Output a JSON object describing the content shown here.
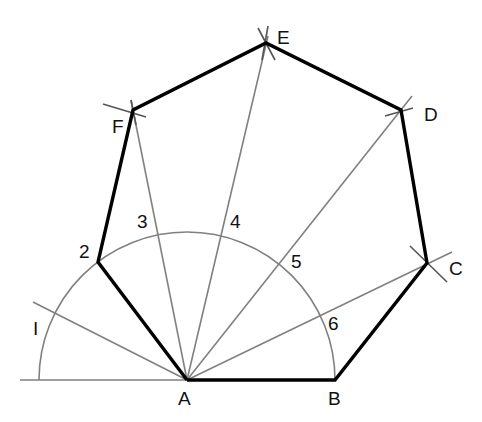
{
  "diagram": {
    "colors": {
      "edge": "#000000",
      "guide": "#808080",
      "label": "#111111"
    },
    "vertices": {
      "A": {
        "label": "A",
        "x": 187,
        "y": 380
      },
      "B": {
        "label": "B",
        "x": 335,
        "y": 380
      },
      "C": {
        "label": "C",
        "x": 427,
        "y": 263
      },
      "D": {
        "label": "D",
        "x": 401,
        "y": 110
      },
      "E": {
        "label": "E",
        "x": 266,
        "y": 43
      },
      "F": {
        "label": "F",
        "x": 133,
        "y": 110
      },
      "P2": {
        "label": "2",
        "x": 98,
        "y": 262
      }
    },
    "arc_divisions": [
      "I",
      "2",
      "3",
      "4",
      "5",
      "6"
    ],
    "labels": {
      "A": "A",
      "B": "B",
      "C": "C",
      "D": "D",
      "E": "E",
      "F": "F",
      "d1": "I",
      "d2": "2",
      "d3": "3",
      "d4": "4",
      "d5": "5",
      "d6": "6"
    },
    "semicircle": {
      "center": "A",
      "radius": 148,
      "from": "baseline-left",
      "to": "B"
    }
  }
}
